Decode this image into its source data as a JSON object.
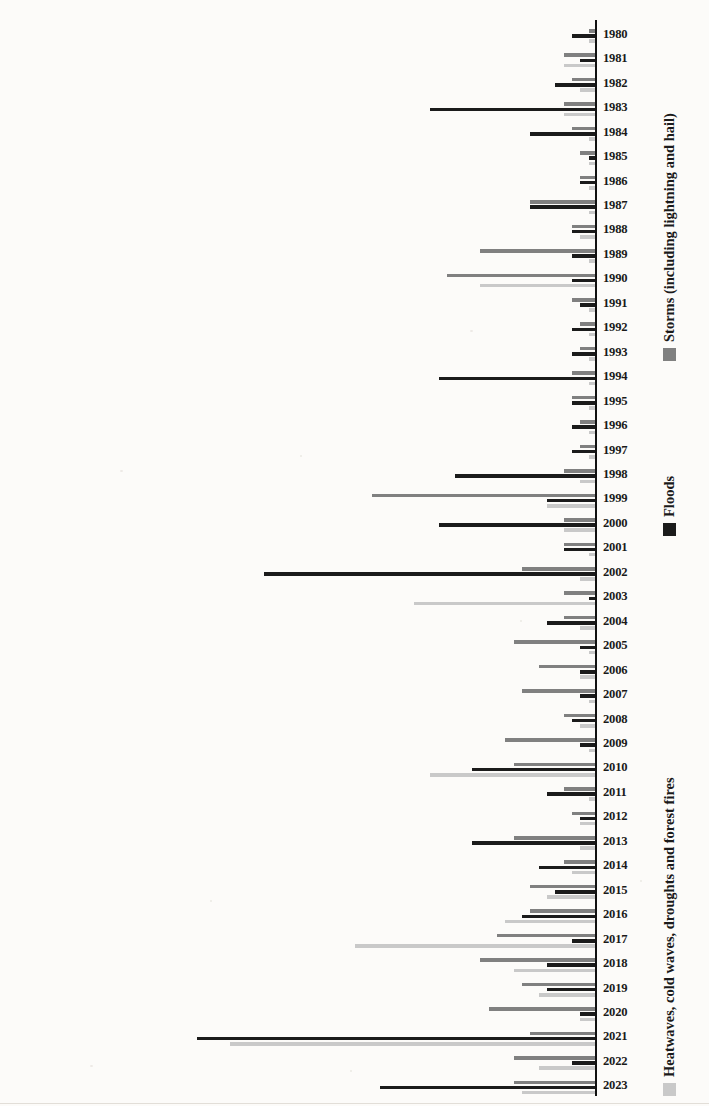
{
  "chart_data": {
    "type": "bar",
    "title": "",
    "subtitle": "",
    "xlabel": "",
    "ylabel": "",
    "orientation": "vertical-bars-rotated-page",
    "grid": false,
    "legend_position": "bottom",
    "value_axis": {
      "min": 0,
      "max": 60,
      "ticks": [
        0,
        10,
        20,
        30,
        40,
        50,
        60
      ],
      "tick_labels": [
        "0",
        "10",
        "20",
        "30",
        "40",
        "50",
        "60"
      ]
    },
    "categories": [
      "2023",
      "2022",
      "2021",
      "2020",
      "2019",
      "2018",
      "2017",
      "2016",
      "2015",
      "2014",
      "2013",
      "2012",
      "2011",
      "2010",
      "2009",
      "2008",
      "2007",
      "2006",
      "2005",
      "2004",
      "2003",
      "2002",
      "2001",
      "2000",
      "1999",
      "1998",
      "1997",
      "1996",
      "1995",
      "1994",
      "1993",
      "1992",
      "1991",
      "1990",
      "1989",
      "1988",
      "1987",
      "1986",
      "1985",
      "1984",
      "1983",
      "1982",
      "1981",
      "1980"
    ],
    "series": [
      {
        "name": "Heatwaves, cold waves, droughts and forest fires",
        "color": "#c9c9c9",
        "values": [
          9,
          7,
          44,
          2,
          7,
          10,
          29,
          11,
          6,
          3,
          2,
          2,
          1,
          20,
          1,
          2,
          1,
          2,
          1,
          2,
          22,
          2,
          1,
          4,
          6,
          2,
          1,
          1,
          1,
          1,
          1,
          1,
          1,
          14,
          1,
          2,
          1,
          1,
          1,
          1,
          4,
          2,
          4,
          1
        ]
      },
      {
        "name": "Floods",
        "color": "#1b1b1b",
        "values": [
          26,
          3,
          48,
          2,
          6,
          6,
          3,
          9,
          5,
          7,
          15,
          2,
          6,
          15,
          2,
          3,
          2,
          2,
          2,
          6,
          1,
          40,
          4,
          19,
          6,
          17,
          3,
          3,
          3,
          19,
          3,
          3,
          2,
          3,
          3,
          3,
          8,
          2,
          1,
          8,
          20,
          5,
          2,
          3
        ]
      },
      {
        "name": "Storms (including lightning and hail)",
        "color": "#808080",
        "values": [
          10,
          10,
          8,
          13,
          9,
          14,
          12,
          8,
          8,
          4,
          10,
          3,
          4,
          10,
          11,
          4,
          9,
          7,
          10,
          4,
          4,
          9,
          4,
          4,
          27,
          4,
          2,
          2,
          3,
          3,
          2,
          2,
          3,
          18,
          14,
          3,
          8,
          2,
          2,
          3,
          4,
          3,
          4,
          1
        ]
      }
    ]
  },
  "legend": {
    "items": [
      {
        "label": "Heatwaves, cold waves, droughts and forest fires",
        "key": "heat"
      },
      {
        "label": "Floods",
        "key": "flood"
      },
      {
        "label": "Storms (including lightning and hail)",
        "key": "storm"
      }
    ]
  }
}
